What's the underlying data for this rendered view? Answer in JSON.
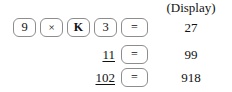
{
  "figure": {
    "kind": "calculator-keystroke-sequence",
    "display_column": {
      "header": "(Display)",
      "values": [
        "27",
        "99",
        "918"
      ]
    },
    "rows": [
      {
        "keys": [
          {
            "label": "9",
            "icon": "digit-9-key"
          },
          {
            "label": "×",
            "icon": "multiply-key"
          },
          {
            "label": "K",
            "icon": "constant-k-key"
          },
          {
            "label": "3",
            "icon": "digit-3-key"
          },
          {
            "label": "=",
            "icon": "equals-key"
          }
        ],
        "operand": "",
        "display": "27"
      },
      {
        "keys": [
          {
            "label": "=",
            "icon": "equals-key"
          }
        ],
        "operand": "11",
        "display": "99"
      },
      {
        "keys": [
          {
            "label": "=",
            "icon": "equals-key"
          }
        ],
        "operand": "102",
        "display": "918"
      }
    ]
  }
}
